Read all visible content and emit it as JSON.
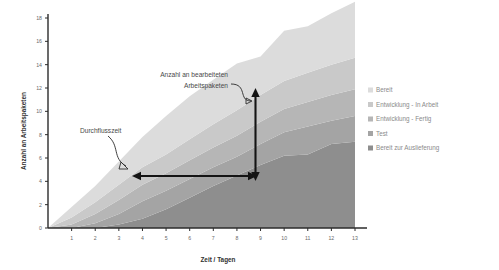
{
  "chart_data": {
    "type": "area",
    "title": "",
    "xlabel": "Zeit / Tagen",
    "ylabel": "Anzahl an Arbeitspaketen",
    "xlim": [
      0,
      13
    ],
    "ylim": [
      0,
      18
    ],
    "ytick_step": 2,
    "grid": false,
    "legend_position": "right",
    "stacked": true,
    "stack_order_bottom_to_top": [
      "Bereit zur Auslieferung",
      "Test",
      "Entwicklung - Fertig",
      "Entwicklung - In Arbeit",
      "Bereit"
    ],
    "x": [
      0,
      1,
      2,
      3,
      4,
      5,
      6,
      7,
      8,
      9,
      10,
      11,
      12,
      13
    ],
    "xticklabels": [
      "1",
      "2",
      "3",
      "4",
      "5",
      "6",
      "7",
      "8",
      "9",
      "10",
      "11",
      "12",
      "13"
    ],
    "yticklabels": [
      "0",
      "2",
      "4",
      "6",
      "8",
      "10",
      "12",
      "14",
      "16",
      "18"
    ],
    "series": [
      {
        "name": "Bereit zur Auslieferung",
        "color": "#8e8e8e",
        "values": [
          0,
          0,
          0,
          0.3,
          0.8,
          1.6,
          2.6,
          3.6,
          4.5,
          5.4,
          6.2,
          6.3,
          7.2,
          7.4
        ]
      },
      {
        "name": "Test",
        "color": "#a4a4a4",
        "values": [
          0,
          0,
          0.4,
          0.9,
          1.5,
          1.6,
          1.6,
          1.6,
          1.6,
          1.8,
          2.0,
          2.4,
          2.0,
          2.2
        ]
      },
      {
        "name": "Entwicklung - Fertig",
        "color": "#b6b6b6",
        "values": [
          0,
          0.3,
          0.8,
          1.2,
          1.4,
          1.5,
          1.6,
          1.7,
          1.8,
          1.9,
          2.0,
          2.1,
          2.2,
          2.3
        ]
      },
      {
        "name": "Entwicklung - In Arbeit",
        "color": "#c9c9c9",
        "values": [
          0,
          0.6,
          1.0,
          1.3,
          1.5,
          1.6,
          1.8,
          2.0,
          2.2,
          2.3,
          2.4,
          2.5,
          2.6,
          2.7
        ]
      },
      {
        "name": "Bereit",
        "color": "#dcdcdc",
        "values": [
          0,
          0.9,
          1.4,
          2.0,
          2.6,
          3.3,
          3.7,
          3.8,
          4.0,
          3.3,
          4.3,
          4.0,
          4.4,
          4.8
        ]
      }
    ],
    "cumulative_totals": [
      0,
      1.8,
      3.6,
      5.7,
      7.8,
      9.6,
      11.3,
      12.7,
      14.1,
      14.7,
      16.9,
      17.3,
      18.4,
      19.4
    ],
    "annotations": [
      {
        "name": "wip-annotation",
        "text_line1": "Anzahl an bearbeiteten",
        "text_line2": "Arbeitspaketen",
        "measure": "vertical",
        "at_x_day": 9
      },
      {
        "name": "lead-time-annotation",
        "text_line1": "Durchflusszeit",
        "text_line2": "",
        "measure": "horizontal",
        "at_y_value": 5
      }
    ]
  },
  "legend": {
    "items": [
      {
        "label": "Bereit",
        "color": "#dcdcdc"
      },
      {
        "label": "Entwicklung - In Arbeit",
        "color": "#c9c9c9"
      },
      {
        "label": "Entwicklung - Fertig",
        "color": "#b6b6b6"
      },
      {
        "label": "Test",
        "color": "#a4a4a4"
      },
      {
        "label": "Bereit zur Auslieferung",
        "color": "#8e8e8e"
      }
    ]
  }
}
